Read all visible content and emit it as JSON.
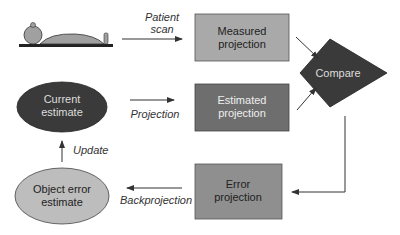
{
  "diagram": {
    "type": "flowchart",
    "nodes": {
      "patient": {
        "icon": "patient-lying-on-table-icon"
      },
      "measured": {
        "line1": "Measured",
        "line2": "projection",
        "fill": "#a9a9a9"
      },
      "estimated": {
        "line1": "Estimated",
        "line2": "projection",
        "fill": "#6e6e6e"
      },
      "compare": {
        "label": "Compare",
        "fill": "#3a3a3a"
      },
      "current": {
        "line1": "Current",
        "line2": "estimate",
        "fill": "#3a3a3a"
      },
      "error_proj": {
        "line1": "Error",
        "line2": "projection",
        "fill": "#8f8f8f"
      },
      "object_error": {
        "line1": "Object error",
        "line2": "estimate",
        "fill": "#bdbdbd"
      }
    },
    "edges": {
      "patient_scan": {
        "line1": "Patient",
        "line2": "scan"
      },
      "projection": {
        "label": "Projection"
      },
      "update": {
        "label": "Update"
      },
      "backprojection": {
        "label": "Backprojection"
      }
    }
  }
}
